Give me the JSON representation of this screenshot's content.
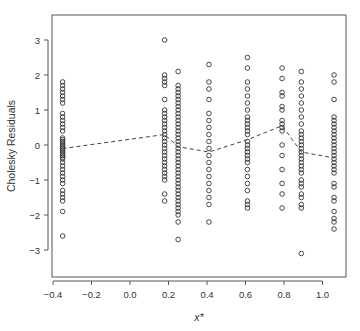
{
  "chart_data": {
    "type": "scatter",
    "title": "",
    "xlabel": "x*",
    "ylabel": "Cholesky Residuals",
    "xlim": [
      -0.42,
      1.12
    ],
    "ylim": [
      -3.75,
      3.75
    ],
    "xticks": [
      -0.4,
      -0.2,
      0.0,
      0.2,
      0.4,
      0.6,
      0.8,
      1.0
    ],
    "xtick_labels": [
      "-0.4",
      "-0.2",
      "0.0",
      "0.2",
      "0.4",
      "0.6",
      "0.8",
      "1.0"
    ],
    "yticks": [
      -3,
      -2,
      -1,
      0,
      1,
      2,
      3
    ],
    "ytick_labels": [
      "-3",
      "-2",
      "-1",
      "0",
      "1",
      "2",
      "3"
    ],
    "grid": false,
    "legend": null,
    "marker": "open-circle",
    "colors": {
      "points": "#333333",
      "trend": "#444444",
      "axis": "#555555",
      "text": "#333333"
    },
    "series": [
      {
        "name": "residuals",
        "columns": [
          {
            "x": -0.35,
            "y": [
              1.8,
              1.7,
              1.6,
              1.5,
              1.4,
              1.3,
              1.2,
              0.9,
              0.8,
              0.7,
              0.6,
              0.5,
              0.4,
              0.2,
              0.15,
              0.1,
              0.05,
              0.0,
              -0.05,
              -0.1,
              -0.15,
              -0.2,
              -0.25,
              -0.3,
              -0.35,
              -0.4,
              -0.5,
              -0.6,
              -0.7,
              -0.8,
              -0.9,
              -1.0,
              -1.1,
              -1.3,
              -1.4,
              -1.5,
              -1.6,
              -1.9,
              -2.6
            ]
          },
          {
            "x": 0.18,
            "y": [
              3.0,
              2.0,
              1.9,
              1.8,
              1.7,
              1.3,
              1.0,
              0.9,
              0.8,
              0.7,
              0.6,
              0.5,
              0.4,
              0.3,
              0.2,
              0.1,
              0.0,
              -0.1,
              -0.2,
              -0.3,
              -0.4,
              -0.5,
              -0.6,
              -0.7,
              -0.8,
              -0.9,
              -1.0,
              -1.4,
              -1.6
            ]
          },
          {
            "x": 0.25,
            "y": [
              2.1,
              1.7,
              1.6,
              1.5,
              1.4,
              1.3,
              1.2,
              1.1,
              1.0,
              0.9,
              0.8,
              0.7,
              0.6,
              0.5,
              0.4,
              0.3,
              0.2,
              0.1,
              0.0,
              -0.1,
              -0.2,
              -0.3,
              -0.4,
              -0.5,
              -0.6,
              -0.7,
              -0.8,
              -0.9,
              -1.0,
              -1.1,
              -1.2,
              -1.3,
              -1.4,
              -1.5,
              -1.6,
              -1.7,
              -1.8,
              -1.9,
              -2.0,
              -2.2,
              -2.7
            ]
          },
          {
            "x": 0.41,
            "y": [
              2.3,
              1.8,
              1.6,
              1.3,
              0.9,
              0.7,
              0.5,
              0.3,
              0.1,
              -0.1,
              -0.3,
              -0.5,
              -0.7,
              -0.9,
              -1.1,
              -1.3,
              -1.5,
              -1.7,
              -2.2
            ]
          },
          {
            "x": 0.61,
            "y": [
              2.5,
              2.2,
              1.8,
              1.6,
              1.4,
              1.2,
              1.0,
              0.8,
              0.7,
              0.6,
              0.5,
              0.4,
              0.3,
              0.1,
              0.0,
              -0.1,
              -0.2,
              -0.3,
              -0.4,
              -0.5,
              -0.7,
              -0.9,
              -1.1,
              -1.3,
              -1.6,
              -1.7,
              -1.8
            ]
          },
          {
            "x": 0.79,
            "y": [
              2.2,
              1.9,
              1.5,
              1.4,
              1.1,
              1.0,
              0.7,
              0.6,
              0.5,
              0.4,
              0.0,
              -0.3,
              -0.7,
              -1.1,
              -1.4,
              -1.8
            ]
          },
          {
            "x": 0.89,
            "y": [
              2.1,
              1.8,
              1.6,
              1.4,
              1.2,
              1.0,
              0.8,
              0.6,
              0.4,
              0.3,
              0.2,
              0.1,
              0.0,
              -0.1,
              -0.2,
              -0.3,
              -0.4,
              -0.5,
              -0.6,
              -0.7,
              -0.8,
              -1.0,
              -1.1,
              -1.2,
              -1.4,
              -1.5,
              -1.7,
              -1.8,
              -3.1
            ]
          },
          {
            "x": 1.06,
            "y": [
              2.0,
              1.8,
              1.3,
              0.8,
              0.7,
              0.6,
              0.5,
              0.4,
              0.3,
              0.2,
              0.1,
              0.0,
              -0.1,
              -0.2,
              -0.3,
              -0.4,
              -0.5,
              -0.6,
              -0.7,
              -0.8,
              -1.1,
              -1.2,
              -1.5,
              -1.6,
              -1.9,
              -2.1,
              -2.2,
              -2.4
            ]
          }
        ]
      },
      {
        "name": "mean trend (dashed)",
        "type": "line",
        "style": "dashed",
        "x": [
          -0.35,
          0.18,
          0.25,
          0.41,
          0.61,
          0.79,
          0.89,
          1.06
        ],
        "y": [
          -0.1,
          0.3,
          -0.05,
          -0.2,
          0.15,
          0.55,
          -0.2,
          -0.37
        ]
      }
    ]
  }
}
